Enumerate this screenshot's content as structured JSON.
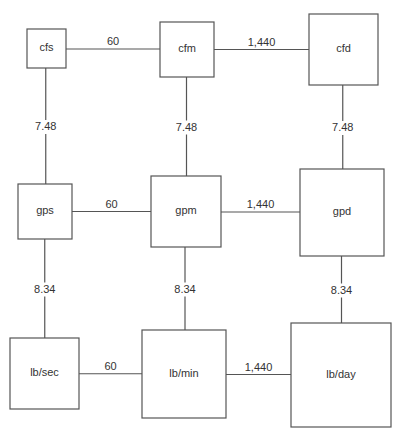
{
  "diagram": {
    "type": "unit-conversion-grid",
    "nodes": [
      {
        "id": "cfs",
        "label": "cfs",
        "row": 0,
        "col": 0
      },
      {
        "id": "cfm",
        "label": "cfm",
        "row": 0,
        "col": 1
      },
      {
        "id": "cfd",
        "label": "cfd",
        "row": 0,
        "col": 2
      },
      {
        "id": "gps",
        "label": "gps",
        "row": 1,
        "col": 0
      },
      {
        "id": "gpm",
        "label": "gpm",
        "row": 1,
        "col": 1
      },
      {
        "id": "gpd",
        "label": "gpd",
        "row": 1,
        "col": 2
      },
      {
        "id": "lbsec",
        "label": "lb/sec",
        "row": 2,
        "col": 0
      },
      {
        "id": "lbmin",
        "label": "lb/min",
        "row": 2,
        "col": 1
      },
      {
        "id": "lbday",
        "label": "lb/day",
        "row": 2,
        "col": 2
      }
    ],
    "edges": [
      {
        "from": "cfs",
        "to": "cfm",
        "label": "60"
      },
      {
        "from": "cfm",
        "to": "cfd",
        "label": "1,440"
      },
      {
        "from": "gps",
        "to": "gpm",
        "label": "60"
      },
      {
        "from": "gpm",
        "to": "gpd",
        "label": "1,440"
      },
      {
        "from": "lbsec",
        "to": "lbmin",
        "label": "60"
      },
      {
        "from": "lbmin",
        "to": "lbday",
        "label": "1,440"
      },
      {
        "from": "cfs",
        "to": "gps",
        "label": "7.48"
      },
      {
        "from": "cfm",
        "to": "gpm",
        "label": "7.48"
      },
      {
        "from": "cfd",
        "to": "gpd",
        "label": "7.48"
      },
      {
        "from": "gps",
        "to": "lbsec",
        "label": "8.34"
      },
      {
        "from": "gpm",
        "to": "lbmin",
        "label": "8.34"
      },
      {
        "from": "gpd",
        "to": "lbday",
        "label": "8.34"
      }
    ]
  }
}
